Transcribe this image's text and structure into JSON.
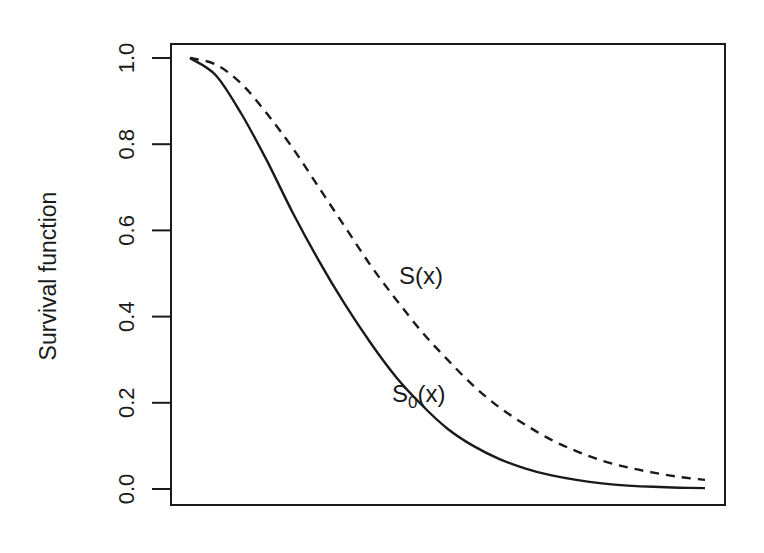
{
  "chart_data": {
    "type": "line",
    "title": "",
    "xlabel": "",
    "ylabel": "Survival function",
    "ylim": [
      0,
      1
    ],
    "y_ticks": [
      "0.0",
      "0.2",
      "0.4",
      "0.6",
      "0.8",
      "1.0"
    ],
    "x_ticks": [],
    "grid": false,
    "legend": "none (curves labeled inline)",
    "x": [
      0,
      0.05,
      0.1,
      0.15,
      0.2,
      0.25,
      0.3,
      0.35,
      0.4,
      0.45,
      0.5,
      0.55,
      0.6,
      0.65,
      0.7,
      0.75,
      0.8,
      0.85,
      0.9,
      0.95,
      1.0
    ],
    "series": [
      {
        "name": "S0(x)",
        "style": "solid",
        "values": [
          1.0,
          0.96,
          0.87,
          0.76,
          0.64,
          0.53,
          0.43,
          0.34,
          0.26,
          0.195,
          0.14,
          0.1,
          0.07,
          0.048,
          0.032,
          0.021,
          0.013,
          0.008,
          0.005,
          0.003,
          0.002
        ]
      },
      {
        "name": "S(x)",
        "style": "dashed",
        "values": [
          1.0,
          0.985,
          0.94,
          0.87,
          0.79,
          0.7,
          0.61,
          0.52,
          0.44,
          0.365,
          0.3,
          0.24,
          0.19,
          0.15,
          0.115,
          0.088,
          0.066,
          0.05,
          0.038,
          0.028,
          0.021
        ]
      }
    ],
    "annotations": [
      {
        "text": "S(x)",
        "x": 0.42,
        "y": 0.43
      },
      {
        "text": "S",
        "subscript": "0",
        "suffix": "(x)",
        "x": 0.42,
        "y": 0.22
      }
    ]
  },
  "labels": {
    "ylabel": "Survival function",
    "s_label": "S(x)",
    "s0_main": "S",
    "s0_sub": "0",
    "s0_suffix": "(x)"
  },
  "colors": {
    "line": "#1a1a1a",
    "background": "#ffffff"
  }
}
